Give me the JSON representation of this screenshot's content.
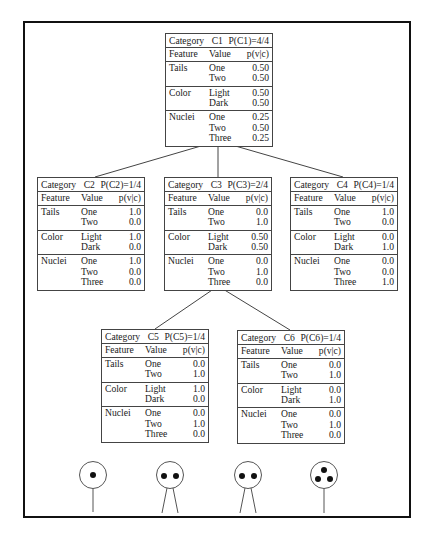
{
  "labels": {
    "category": "Category",
    "feature": "Feature",
    "value": "Value",
    "prob": "p(v|c)"
  },
  "nodes": {
    "c1": {
      "name": "C1",
      "prob": "P(C1)=4/4",
      "features": [
        {
          "feature": "Tails",
          "values": [
            "One",
            "Two"
          ],
          "probs": [
            "0.50",
            "0.50"
          ]
        },
        {
          "feature": "Color",
          "values": [
            "Light",
            "Dark"
          ],
          "probs": [
            "0.50",
            "0.50"
          ]
        },
        {
          "feature": "Nuclei",
          "values": [
            "One",
            "Two",
            "Three"
          ],
          "probs": [
            "0.25",
            "0.50",
            "0.25"
          ]
        }
      ]
    },
    "c2": {
      "name": "C2",
      "prob": "P(C2)=1/4",
      "features": [
        {
          "feature": "Tails",
          "values": [
            "One",
            "Two"
          ],
          "probs": [
            "1.0",
            "0.0"
          ]
        },
        {
          "feature": "Color",
          "values": [
            "Light",
            "Dark"
          ],
          "probs": [
            "1.0",
            "0.0"
          ]
        },
        {
          "feature": "Nuclei",
          "values": [
            "One",
            "Two",
            "Three"
          ],
          "probs": [
            "1.0",
            "0.0",
            "0.0"
          ]
        }
      ]
    },
    "c3": {
      "name": "C3",
      "prob": "P(C3)=2/4",
      "features": [
        {
          "feature": "Tails",
          "values": [
            "One",
            "Two"
          ],
          "probs": [
            "0.0",
            "1.0"
          ]
        },
        {
          "feature": "Color",
          "values": [
            "Light",
            "Dark"
          ],
          "probs": [
            "0.50",
            "0.50"
          ]
        },
        {
          "feature": "Nuclei",
          "values": [
            "One",
            "Two",
            "Three"
          ],
          "probs": [
            "0.0",
            "1.0",
            "0.0"
          ]
        }
      ]
    },
    "c4": {
      "name": "C4",
      "prob": "P(C4)=1/4",
      "features": [
        {
          "feature": "Tails",
          "values": [
            "One",
            "Two"
          ],
          "probs": [
            "1.0",
            "0.0"
          ]
        },
        {
          "feature": "Color",
          "values": [
            "Light",
            "Dark"
          ],
          "probs": [
            "0.0",
            "1.0"
          ]
        },
        {
          "feature": "Nuclei",
          "values": [
            "One",
            "Two",
            "Three"
          ],
          "probs": [
            "0.0",
            "0.0",
            "1.0"
          ]
        }
      ]
    },
    "c5": {
      "name": "C5",
      "prob": "P(C5)=1/4",
      "features": [
        {
          "feature": "Tails",
          "values": [
            "One",
            "Two"
          ],
          "probs": [
            "0.0",
            "1.0"
          ]
        },
        {
          "feature": "Color",
          "values": [
            "Light",
            "Dark"
          ],
          "probs": [
            "1.0",
            "0.0"
          ]
        },
        {
          "feature": "Nuclei",
          "values": [
            "One",
            "Two",
            "Three"
          ],
          "probs": [
            "0.0",
            "1.0",
            "0.0"
          ]
        }
      ]
    },
    "c6": {
      "name": "C6",
      "prob": "P(C6)=1/4",
      "features": [
        {
          "feature": "Tails",
          "values": [
            "One",
            "Two"
          ],
          "probs": [
            "0.0",
            "1.0"
          ]
        },
        {
          "feature": "Color",
          "values": [
            "Light",
            "Dark"
          ],
          "probs": [
            "0.0",
            "1.0"
          ]
        },
        {
          "feature": "Nuclei",
          "values": [
            "One",
            "Two",
            "Three"
          ],
          "probs": [
            "0.0",
            "1.0",
            "0.0"
          ]
        }
      ]
    }
  },
  "organisms": [
    {
      "nuclei": 1,
      "tails": 1,
      "color": "light"
    },
    {
      "nuclei": 2,
      "tails": 2,
      "color": "light"
    },
    {
      "nuclei": 2,
      "tails": 2,
      "color": "dark"
    },
    {
      "nuclei": 3,
      "tails": 1,
      "color": "dark"
    }
  ],
  "colors": {
    "frame": "#111111",
    "lines": "#444444",
    "text": "#1a1a1a",
    "nucleus": "#111111"
  }
}
